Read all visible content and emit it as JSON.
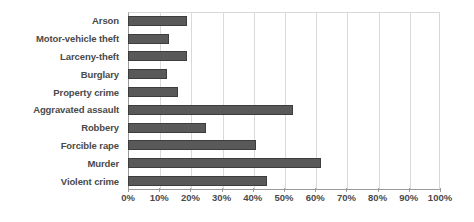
{
  "chart_data": {
    "type": "bar",
    "orientation": "horizontal",
    "title": "",
    "xlabel": "",
    "ylabel": "",
    "xlim": [
      0,
      100
    ],
    "xtick_labels": [
      "0%",
      "10%",
      "20%",
      "30%",
      "40%",
      "50%",
      "60%",
      "70%",
      "80%",
      "90%",
      "100%"
    ],
    "xtick_values": [
      0,
      10,
      20,
      30,
      40,
      50,
      60,
      70,
      80,
      90,
      100
    ],
    "grid": true,
    "legend": "none",
    "bar_color": "#595959",
    "bar_edge_color": "#3d3d3d",
    "categories": [
      "Arson",
      "Motor-vehicle theft",
      "Larceny-theft",
      "Burglary",
      "Property crime",
      "Aggravated assault",
      "Robbery",
      "Forcible rape",
      "Murder",
      "Violent crime"
    ],
    "values": [
      19,
      13,
      19,
      12.5,
      16,
      53,
      25,
      41,
      62,
      44.5
    ]
  }
}
